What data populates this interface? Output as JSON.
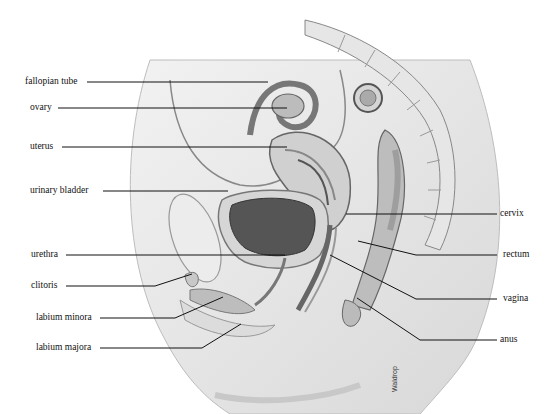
{
  "diagram": {
    "labels_left": [
      {
        "id": "fallopian-tube",
        "text": "fallopian tube"
      },
      {
        "id": "ovary",
        "text": "ovary"
      },
      {
        "id": "uterus",
        "text": "uterus"
      },
      {
        "id": "urinary-bladder",
        "text": "urinary bladder"
      },
      {
        "id": "urethra",
        "text": "urethra"
      },
      {
        "id": "clitoris",
        "text": "clitoris"
      },
      {
        "id": "labium-minora",
        "text": "labium minora"
      },
      {
        "id": "labium-majora",
        "text": "labium majora"
      }
    ],
    "labels_right": [
      {
        "id": "cervix",
        "text": "cervix"
      },
      {
        "id": "rectum",
        "text": "rectum"
      },
      {
        "id": "vagina",
        "text": "vagina"
      },
      {
        "id": "anus",
        "text": "anus"
      }
    ],
    "credit": "Waldrop"
  }
}
